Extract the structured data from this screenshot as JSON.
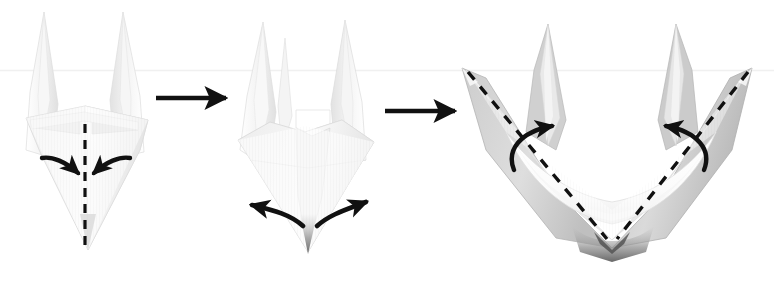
{
  "figure": {
    "title": "Origami folding sequence — three steps",
    "background_color": "#ffffff",
    "width": 774,
    "height": 284,
    "scan_artifact_line": {
      "name": "faint-horizontal-scan-line",
      "y": 70,
      "color": "#f0f0f0"
    }
  },
  "palette": {
    "ink": "#111111",
    "paper_white": "#fcfcfc",
    "paper_light": "#f4f4f4",
    "paper_mid": "#e6e6e6",
    "paper_shade": "#d6d6d6",
    "paper_deep": "#bdbdbd",
    "paper_dark": "#9a9a9a",
    "paper_darkest": "#6e6e6e",
    "edge_line": "#cfcfcf"
  },
  "panels": [
    {
      "id": "panel-1",
      "step_number": 1,
      "name": "origami-step-1",
      "description": "Narrow kite-shaped model with two tall spikes at the top and a point at the bottom; a vertical dashed valley-fold line runs down the center and two curved arrows point inward toward it.",
      "center_x": 87,
      "annotations": {
        "dashed_fold_line": {
          "name": "center-dashed-fold-line",
          "orientation": "vertical",
          "x": 85,
          "y_start": 124,
          "y_end": 250,
          "dash": "9 7",
          "width": 3.2
        },
        "arrows": [
          {
            "name": "fold-arrow-left-inward",
            "direction": "inward-right",
            "from": [
              45,
              160
            ],
            "to": [
              80,
              176
            ]
          },
          {
            "name": "fold-arrow-right-inward",
            "direction": "inward-left",
            "from": [
              127,
              160
            ],
            "to": [
              92,
              176
            ]
          }
        ]
      }
    },
    {
      "id": "panel-2",
      "step_number": 2,
      "name": "origami-step-2",
      "description": "Result of the center fold: a taller narrow form with two main spikes, a small third spike, an open cavity in the middle and a sharp bottom point; two curved arrows spread outward from the bottom point.",
      "center_x": 305,
      "annotations": {
        "arrows": [
          {
            "name": "open-arrow-left-outward",
            "direction": "outward-left",
            "from": [
              303,
              228
            ],
            "to": [
              248,
              204
            ]
          },
          {
            "name": "open-arrow-right-outward",
            "direction": "outward-right",
            "from": [
              315,
              228
            ],
            "to": [
              368,
              200
            ]
          }
        ]
      }
    },
    {
      "id": "panel-3",
      "step_number": 3,
      "name": "origami-step-3",
      "description": "Opened V-shaped boat/crown form seen in three-quarter view, with two outer wings, two inner spikes, dashed fold lines running along each wing down to the bottom vertex, and two curved arrows indicating the inner flaps lift upward.",
      "center_x": 612,
      "annotations": {
        "dashed_fold_lines": [
          {
            "name": "dashed-fold-line-left-wing",
            "from": [
              468,
              72
            ],
            "to": [
              607,
              239
            ],
            "dash": "10 9",
            "width": 3.4
          },
          {
            "name": "dashed-fold-line-right-wing",
            "from": [
              748,
              72
            ],
            "to": [
              617,
              239
            ],
            "dash": "10 9",
            "width": 3.4
          }
        ],
        "arrows": [
          {
            "name": "lift-arrow-left",
            "direction": "up-right",
            "from": [
              518,
              163
            ],
            "to": [
              557,
              122
            ]
          },
          {
            "name": "lift-arrow-right",
            "direction": "up-left",
            "from": [
              700,
              163
            ],
            "to": [
              662,
              122
            ]
          }
        ]
      }
    }
  ],
  "transition_arrows": [
    {
      "name": "transition-arrow-1",
      "from_panel": "panel-1",
      "to_panel": "panel-2",
      "x_start": 156,
      "x_end": 228,
      "y": 98
    },
    {
      "name": "transition-arrow-2",
      "from_panel": "panel-2",
      "to_panel": "panel-3",
      "x_start": 385,
      "x_end": 457,
      "y": 111
    }
  ]
}
